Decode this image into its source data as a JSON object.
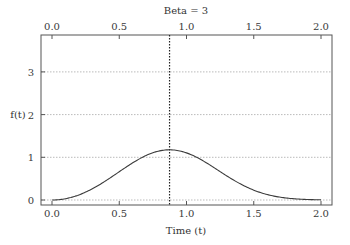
{
  "chart_data": {
    "type": "line",
    "title": "Beta =  3",
    "xlabel": "Time (t)",
    "ylabel": "f(t)",
    "xlim": [
      -0.08,
      2.08
    ],
    "ylim": [
      -0.12,
      3.87
    ],
    "x_ticks": [
      "0.0",
      "0.5",
      "1.0",
      "1.5",
      "2.0"
    ],
    "x_tick_values": [
      0.0,
      0.5,
      1.0,
      1.5,
      2.0
    ],
    "top_x_ticks": [
      "0.0",
      "0.5",
      "1.0",
      "1.5",
      "2.0"
    ],
    "y_ticks": [
      "0",
      "1",
      "2",
      "3"
    ],
    "y_tick_values": [
      0,
      1,
      2,
      3
    ],
    "grid": "horizontal dotted",
    "legend": "none",
    "annotations": [
      {
        "type": "vertical-dotted-line",
        "x": 0.874,
        "label": "mode"
      }
    ],
    "series": [
      {
        "name": "Weibull pdf (beta = 3)",
        "x": [
          0.0,
          0.1,
          0.2,
          0.3,
          0.4,
          0.5,
          0.6,
          0.7,
          0.8,
          0.874,
          0.9,
          1.0,
          1.1,
          1.2,
          1.3,
          1.4,
          1.5,
          1.6,
          1.7,
          1.8,
          1.9,
          2.0
        ],
        "values": [
          0.0,
          0.03,
          0.119,
          0.263,
          0.449,
          0.662,
          0.87,
          1.043,
          1.151,
          1.175,
          1.172,
          1.104,
          0.959,
          0.767,
          0.563,
          0.378,
          0.231,
          0.128,
          0.064,
          0.029,
          0.011,
          0.004
        ]
      }
    ],
    "colors": {
      "curve": "#3c3c3c",
      "frame": "#555555",
      "grid": "#bbbbbb",
      "vline": "#222222"
    }
  }
}
